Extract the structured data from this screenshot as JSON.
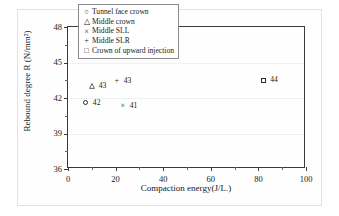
{
  "chart_data": {
    "type": "scatter",
    "title": "",
    "xlabel": "Compaction energy(J/L.)",
    "ylabel": "Rebound degree R (N/mm²)",
    "xlim": [
      0,
      100
    ],
    "ylim": [
      36,
      48
    ],
    "xticks": [
      "0",
      "20",
      "40",
      "60",
      "80",
      "100"
    ],
    "yticks": [
      "36",
      "39",
      "42",
      "45",
      "48"
    ],
    "grid": true,
    "legend_position": "top-center",
    "series": [
      {
        "name": "Tunnel face crown",
        "marker": "circle",
        "points": [
          {
            "x": 7.5,
            "y": 41.6,
            "label": "42"
          }
        ]
      },
      {
        "name": "Middle crown",
        "marker": "triangle",
        "points": [
          {
            "x": 10,
            "y": 43.0,
            "label": "43"
          }
        ]
      },
      {
        "name": "Middle SLL",
        "marker": "cross",
        "points": [
          {
            "x": 23,
            "y": 41.3,
            "label": "41"
          }
        ]
      },
      {
        "name": "Middle SLR",
        "marker": "plus",
        "points": [
          {
            "x": 20.5,
            "y": 43.4,
            "label": "43"
          }
        ]
      },
      {
        "name": "Crown of upward injection",
        "marker": "square",
        "points": [
          {
            "x": 82,
            "y": 43.5,
            "label": "44"
          }
        ]
      }
    ]
  },
  "legend": {
    "items": [
      {
        "marker_glyph": "○",
        "label": "Tunnel face crown"
      },
      {
        "marker_glyph": "△",
        "label": "Middle crown"
      },
      {
        "marker_glyph": "×",
        "label": "Middle SLL"
      },
      {
        "marker_glyph": "+",
        "label": "Middle SLR"
      },
      {
        "marker_glyph": "□",
        "label": "Crown of upward injection"
      }
    ]
  },
  "axes": {
    "x_title": "Compaction energy(J/L.)",
    "y_title": "Rebound degree R (N/mm²)",
    "x_tick_labels": [
      "0",
      "20",
      "40",
      "60",
      "80",
      "100"
    ],
    "y_tick_labels": [
      "36",
      "39",
      "42",
      "45",
      "48"
    ]
  },
  "colors": {
    "axis": "#3a3a3a",
    "marker": "#2a2a2a",
    "grid": "#f0f0f0",
    "background": "#ffffff"
  }
}
